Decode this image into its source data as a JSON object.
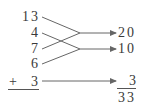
{
  "diagram": {
    "addends": [
      {
        "id": "a1",
        "value": "13"
      },
      {
        "id": "a2",
        "value": "4"
      },
      {
        "id": "a3",
        "value": "7"
      },
      {
        "id": "a4",
        "value": "6"
      },
      {
        "id": "a5",
        "value": "3"
      }
    ],
    "plus_sign": "+",
    "groupings": [
      {
        "from": [
          "13",
          "7"
        ],
        "to": "20"
      },
      {
        "from": [
          "4",
          "6"
        ],
        "to": "10"
      },
      {
        "from": [
          "3"
        ],
        "to": "3"
      }
    ],
    "partial_sums": [
      {
        "value": "20"
      },
      {
        "value": "10"
      },
      {
        "value": "3"
      }
    ],
    "total": "33",
    "colors": {
      "text": "#3a3a3a",
      "line": "#666666"
    }
  }
}
